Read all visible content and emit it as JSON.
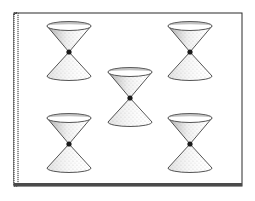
{
  "diagram": {
    "type": "light-cones-on-sheet",
    "background": "#ffffff",
    "ink": "#2a2a2a",
    "sheet": {
      "x": 14,
      "y": 13,
      "width": 228,
      "height": 173
    },
    "cones": [
      {
        "id": "top-left",
        "cx": 69,
        "cy": 52
      },
      {
        "id": "top-right",
        "cx": 190,
        "cy": 52
      },
      {
        "id": "center",
        "cx": 130,
        "cy": 98
      },
      {
        "id": "bottom-left",
        "cx": 69,
        "cy": 144
      },
      {
        "id": "bottom-right",
        "cx": 190,
        "cy": 144
      }
    ],
    "cone_half_width": 22,
    "cone_top_height": 26,
    "cone_bottom_height": 24
  }
}
